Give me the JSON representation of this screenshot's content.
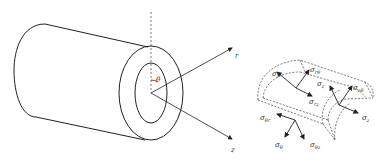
{
  "left_figure": {
    "title": "hollow-cylinder",
    "labels": {
      "theta": "θ",
      "r": "r",
      "z": "z"
    }
  },
  "right_figure": {
    "title": "cylindrical-stress-element",
    "labels": {
      "top_radial": {
        "base": "σ",
        "sub": "r"
      },
      "top_shear_rtheta": {
        "base": "σ",
        "sub": "rθ"
      },
      "top_shear_rz": {
        "base": "σ",
        "sub": "rz"
      },
      "right_axial": {
        "base": "σ",
        "sub": "z"
      },
      "right_shear_ztheta": {
        "base": "σ",
        "sub": "zθ"
      },
      "right_shear_zr": {
        "base": "σ",
        "sub": "z"
      },
      "bottom_shear_thetar": {
        "base": "σ",
        "sub": "θr"
      },
      "bottom_hoop": {
        "base": "σ",
        "sub": "θ"
      },
      "bottom_shear_thetaz": {
        "base": "σ",
        "sub": "θz"
      }
    }
  }
}
